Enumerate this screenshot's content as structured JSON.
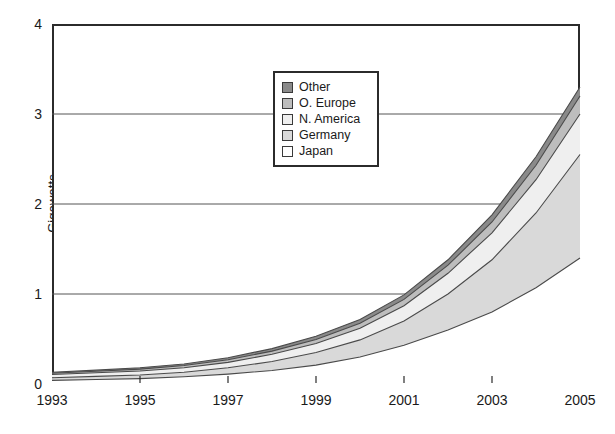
{
  "chart_data": {
    "type": "area",
    "stacked": true,
    "title": "",
    "subtitle": "",
    "xlabel": "",
    "ylabel": "Gigawatts",
    "x": [
      1993,
      1994,
      1995,
      1996,
      1997,
      1998,
      1999,
      2000,
      2001,
      2002,
      2003,
      2004,
      2005
    ],
    "xlim": [
      1993,
      2005
    ],
    "ylim": [
      0,
      4
    ],
    "x_tick_labels": [
      "1993",
      "1995",
      "1997",
      "1999",
      "2001",
      "2003",
      "2005"
    ],
    "x_ticks": [
      1993,
      1995,
      1997,
      1999,
      2001,
      2003,
      2005
    ],
    "y_tick_labels": [
      "0",
      "1",
      "2",
      "3",
      "4"
    ],
    "y_ticks": [
      0,
      1,
      2,
      3,
      4
    ],
    "grid": "horizontal",
    "legend_position": "upper-center",
    "stack_order_bottom_to_top": [
      "Japan",
      "Germany",
      "N. America",
      "O. Europe",
      "Other"
    ],
    "series": [
      {
        "name": "Japan",
        "color": "#ffffff",
        "values": [
          0.04,
          0.05,
          0.06,
          0.08,
          0.11,
          0.15,
          0.21,
          0.3,
          0.43,
          0.6,
          0.8,
          1.07,
          1.4
        ]
      },
      {
        "name": "Germany",
        "color": "#d9d9d9",
        "values": [
          0.03,
          0.035,
          0.04,
          0.05,
          0.07,
          0.1,
          0.14,
          0.19,
          0.27,
          0.4,
          0.58,
          0.83,
          1.15
        ]
      },
      {
        "name": "N. America",
        "color": "#efefef",
        "values": [
          0.035,
          0.04,
          0.045,
          0.05,
          0.06,
          0.08,
          0.1,
          0.13,
          0.17,
          0.23,
          0.3,
          0.37,
          0.45
        ]
      },
      {
        "name": "O. Europe",
        "color": "#bdbdbd",
        "values": [
          0.015,
          0.017,
          0.02,
          0.025,
          0.03,
          0.035,
          0.045,
          0.055,
          0.07,
          0.09,
          0.12,
          0.16,
          0.2
        ]
      },
      {
        "name": "Other",
        "color": "#8a8a8a",
        "values": [
          0.01,
          0.012,
          0.015,
          0.018,
          0.022,
          0.028,
          0.035,
          0.042,
          0.05,
          0.06,
          0.08,
          0.095,
          0.1
        ]
      }
    ],
    "totals": [
      0.13,
      0.154,
      0.18,
      0.223,
      0.292,
      0.393,
      0.53,
      0.717,
      0.99,
      1.38,
      1.88,
      2.525,
      3.3
    ]
  },
  "axes": {
    "y_title": "Gigawatts",
    "y_labels": [
      "4",
      "3",
      "2",
      "1",
      "0"
    ],
    "x_labels": [
      "1993",
      "1995",
      "1997",
      "1999",
      "2001",
      "2003",
      "2005"
    ]
  },
  "legend": {
    "items": [
      {
        "label": "Other",
        "swatch": "#8a8a8a"
      },
      {
        "label": "O. Europe",
        "swatch": "#bdbdbd"
      },
      {
        "label": "N. America",
        "swatch": "#efefef"
      },
      {
        "label": "Germany",
        "swatch": "#d9d9d9"
      },
      {
        "label": "Japan",
        "swatch": "#ffffff"
      }
    ]
  },
  "style": {
    "axis_color": "#2b2b2b",
    "grid_color": "#555555",
    "line_color": "#4a4a4a",
    "background": "#ffffff"
  }
}
